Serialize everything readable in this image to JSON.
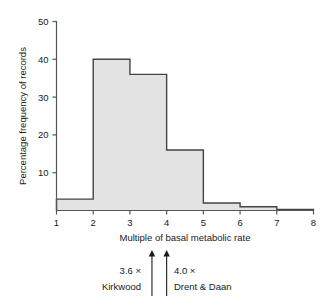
{
  "chart_data": {
    "type": "bar",
    "title": "",
    "subtitle": "",
    "xlabel": "Multiple of basal metabolic rate",
    "ylabel": "Percentage frequency of records",
    "xlim": [
      1,
      8
    ],
    "ylim": [
      0,
      50
    ],
    "grid": false,
    "legend": null,
    "bin_edges": [
      1,
      2,
      3,
      4,
      5,
      6,
      7,
      8
    ],
    "categories": [
      "1-2",
      "2-3",
      "3-4",
      "4-5",
      "5-6",
      "6-7",
      "7-8"
    ],
    "values": [
      3,
      40,
      36,
      16,
      2,
      1,
      0.3
    ],
    "x_ticks": [
      "1",
      "2",
      "3",
      "4",
      "5",
      "6",
      "7",
      "8"
    ],
    "y_ticks": [
      "10",
      "20",
      "30",
      "40",
      "50"
    ],
    "y_tick_values": [
      10,
      20,
      30,
      40,
      50
    ],
    "bar_fill_color": "#e3e3e3",
    "bar_stroke_color": "#444444",
    "axis_color": "#555555",
    "annotations": [
      {
        "id": "kirkwood",
        "x_value": 3.6,
        "value_label": "3.6 ×",
        "source_label": "Kirkwood",
        "marker": "up-arrow"
      },
      {
        "id": "drent-daan",
        "x_value": 4.0,
        "value_label": "4.0 ×",
        "source_label": "Drent & Daan",
        "marker": "up-arrow"
      }
    ]
  },
  "figure": {
    "name": "histogram-of-basal-metabolic-rate-multiples"
  }
}
